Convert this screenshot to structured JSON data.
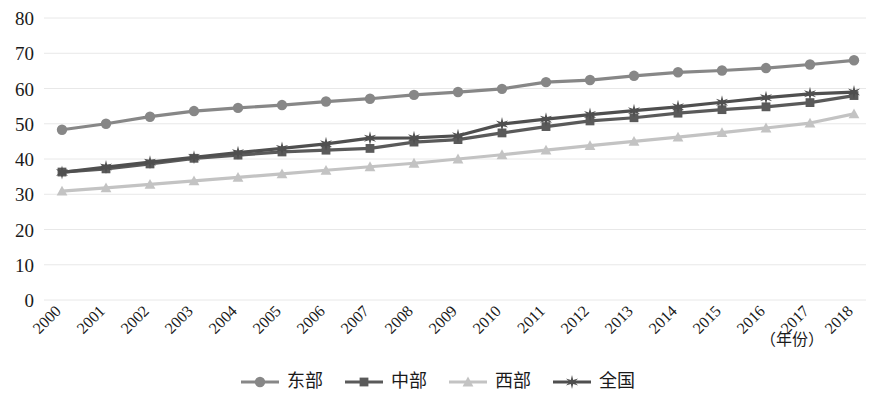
{
  "chart_data": {
    "type": "line",
    "title": "",
    "xlabel": "（年份）",
    "ylabel": "",
    "ylim": [
      0,
      80
    ],
    "ytick_step": 10,
    "yticks": [
      "0",
      "10",
      "20",
      "30",
      "40",
      "50",
      "60",
      "70",
      "80"
    ],
    "grid": true,
    "legend_position": "bottom",
    "categories": [
      "2000",
      "2001",
      "2002",
      "2003",
      "2004",
      "2005",
      "2006",
      "2007",
      "2008",
      "2009",
      "2010",
      "2011",
      "2012",
      "2013",
      "2014",
      "2015",
      "2016",
      "2017",
      "2018"
    ],
    "series": [
      {
        "name": "东部",
        "color": "#878787",
        "marker": "circle",
        "values": [
          48.3,
          50.0,
          52.0,
          53.6,
          54.5,
          55.3,
          56.3,
          57.1,
          58.2,
          59.0,
          59.9,
          61.8,
          62.4,
          63.6,
          64.6,
          65.1,
          65.8,
          66.8,
          68.0
        ]
      },
      {
        "name": "中部",
        "color": "#5a5a5a",
        "marker": "square",
        "values": [
          36.3,
          37.2,
          38.6,
          40.2,
          41.1,
          42.0,
          42.5,
          43.0,
          44.8,
          45.5,
          47.4,
          49.2,
          50.8,
          51.7,
          53.0,
          54.0,
          54.8,
          56.0,
          58.0
        ]
      },
      {
        "name": "西部",
        "color": "#c3c3c3",
        "marker": "triangle",
        "values": [
          30.9,
          31.8,
          32.8,
          33.8,
          34.8,
          35.8,
          36.8,
          37.8,
          38.8,
          40.0,
          41.2,
          42.5,
          43.8,
          45.0,
          46.2,
          47.5,
          48.8,
          50.2,
          52.8
        ]
      },
      {
        "name": "全国",
        "color": "#4f4f4f",
        "marker": "star",
        "values": [
          36.2,
          37.7,
          39.1,
          40.5,
          41.8,
          43.0,
          44.3,
          45.9,
          46.0,
          46.6,
          49.9,
          51.3,
          52.6,
          53.7,
          54.8,
          56.1,
          57.4,
          58.5,
          59.0
        ]
      }
    ]
  },
  "legend": {
    "items": [
      {
        "label": "东部"
      },
      {
        "label": "中部"
      },
      {
        "label": "西部"
      },
      {
        "label": "全国"
      }
    ]
  }
}
